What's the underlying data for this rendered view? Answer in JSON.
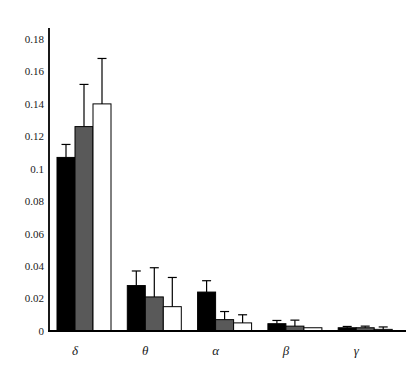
{
  "chart_data": {
    "type": "bar",
    "title": "",
    "xlabel": "",
    "ylabel": "",
    "categories": [
      "δ",
      "θ",
      "α",
      "β",
      "γ"
    ],
    "series": [
      {
        "name": "black",
        "color": "#000000",
        "values": [
          0.107,
          0.028,
          0.024,
          0.0045,
          0.002
        ],
        "errors": [
          0.008,
          0.009,
          0.007,
          0.002,
          0.0008
        ]
      },
      {
        "name": "gray",
        "color": "#595959",
        "values": [
          0.126,
          0.021,
          0.007,
          0.003,
          0.002
        ],
        "errors": [
          0.026,
          0.018,
          0.005,
          0.0037,
          0.001
        ]
      },
      {
        "name": "white",
        "color": "#ffffff",
        "values": [
          0.14,
          0.015,
          0.005,
          0.002,
          0.001
        ],
        "errors": [
          0.028,
          0.018,
          0.005,
          0,
          0.0015
        ]
      }
    ],
    "ylim": [
      0,
      0.18
    ],
    "ytick_step": 0.02,
    "ytick_labels": [
      "0",
      "0.02",
      "0.04",
      "0.06",
      "0.08",
      "0.1",
      "0.12",
      "0.14",
      "0.16",
      "0.18"
    ],
    "grid": false,
    "legend": "none",
    "error_bars": "upper-only with top cap",
    "axis_color": "#000000",
    "text_color": "#1a1a1a"
  }
}
